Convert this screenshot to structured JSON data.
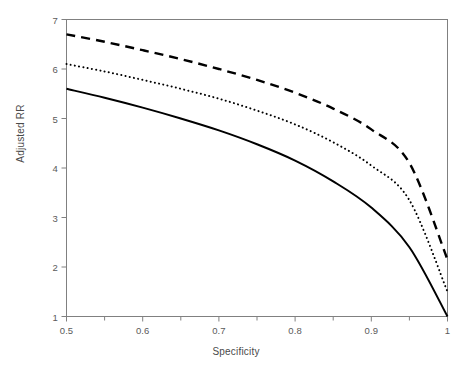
{
  "chart_data": {
    "type": "line",
    "title": "",
    "xlabel": "Specificity",
    "ylabel": "Adjusted RR",
    "xlim": [
      0.5,
      1.0
    ],
    "ylim": [
      1,
      7
    ],
    "grid": false,
    "legend": "none",
    "xticks": [
      0.5,
      0.6,
      0.7,
      0.8,
      0.9,
      1.0
    ],
    "xtick_labels": [
      "0.5",
      "0.6",
      "0.7",
      "0.8",
      "0.9",
      "1"
    ],
    "xminor_ticks": [
      0.55,
      0.65,
      0.75,
      0.85,
      0.95
    ],
    "yticks": [
      1,
      2,
      3,
      4,
      5,
      6,
      7
    ],
    "ytick_labels": [
      "1",
      "2",
      "3",
      "4",
      "5",
      "6",
      "7"
    ],
    "x": [
      0.5,
      0.55,
      0.6,
      0.65,
      0.7,
      0.75,
      0.8,
      0.85,
      0.9,
      0.95,
      1.0
    ],
    "series": [
      {
        "name": "solid-curve",
        "style": "solid",
        "color": "#000000",
        "width": 2.0,
        "values": [
          5.6,
          5.42,
          5.22,
          5.0,
          4.76,
          4.48,
          4.15,
          3.73,
          3.2,
          2.4,
          1.0
        ]
      },
      {
        "name": "dotted-curve",
        "style": "dotted",
        "color": "#000000",
        "width": 2.0,
        "values": [
          6.1,
          5.95,
          5.78,
          5.6,
          5.4,
          5.16,
          4.88,
          4.52,
          4.05,
          3.35,
          1.5
        ]
      },
      {
        "name": "dashed-curve",
        "style": "dashed",
        "color": "#000000",
        "width": 2.4,
        "values": [
          6.7,
          6.55,
          6.38,
          6.2,
          6.0,
          5.78,
          5.52,
          5.2,
          4.78,
          4.1,
          2.15
        ]
      }
    ],
    "axis_color": "#808080",
    "text_color": "#555555"
  },
  "axis_titles": {
    "x": "Specificity",
    "y": "Adjusted RR"
  }
}
